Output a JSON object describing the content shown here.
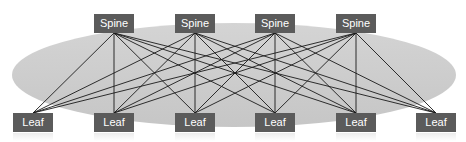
{
  "diagram": {
    "type": "spine-leaf network topology",
    "background_ellipse": {
      "cx": 234,
      "cy": 75,
      "rx": 222,
      "ry": 52,
      "color": "#cdcdcd"
    },
    "node_color": "#5b5b5b",
    "node_text_color": "#ffffff",
    "link_color": "#1a1a1a",
    "spines": [
      {
        "label": "Spine",
        "x": 94,
        "y": 14
      },
      {
        "label": "Spine",
        "x": 175,
        "y": 14
      },
      {
        "label": "Spine",
        "x": 255,
        "y": 14
      },
      {
        "label": "Spine",
        "x": 336,
        "y": 14
      }
    ],
    "leaves": [
      {
        "label": "Leaf",
        "x": 13,
        "y": 113
      },
      {
        "label": "Leaf",
        "x": 94,
        "y": 113
      },
      {
        "label": "Leaf",
        "x": 175,
        "y": 113
      },
      {
        "label": "Leaf",
        "x": 255,
        "y": 113
      },
      {
        "label": "Leaf",
        "x": 336,
        "y": 113
      },
      {
        "label": "Leaf",
        "x": 416,
        "y": 113
      }
    ],
    "links": "full-mesh: every spine connects to every leaf"
  }
}
